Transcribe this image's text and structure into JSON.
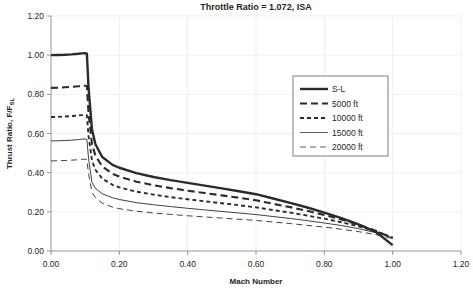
{
  "chart_data": {
    "type": "line",
    "title": "Throttle Ratio = 1.072, ISA",
    "xlabel": "Mach Number",
    "ylabel": "Thrust Ratio, F/F",
    "ylabel_sub": "SL",
    "xlim": [
      0.0,
      1.2
    ],
    "ylim": [
      0.0,
      1.2
    ],
    "grid": true,
    "legend_position": "upper-right-inside",
    "xticks": [
      "0.00",
      "0.20",
      "0.40",
      "0.60",
      "0.80",
      "1.00",
      "1.20"
    ],
    "xtick_values": [
      0.0,
      0.2,
      0.4,
      0.6,
      0.8,
      1.0,
      1.2
    ],
    "yticks": [
      "0.00",
      "0.20",
      "0.40",
      "0.60",
      "0.80",
      "1.00",
      "1.20"
    ],
    "ytick_values": [
      0.0,
      0.2,
      0.4,
      0.6,
      0.8,
      1.0,
      1.2
    ],
    "x": [
      0.0,
      0.02,
      0.04,
      0.06,
      0.08,
      0.09,
      0.1,
      0.105,
      0.11,
      0.12,
      0.13,
      0.15,
      0.18,
      0.2,
      0.25,
      0.3,
      0.35,
      0.4,
      0.45,
      0.5,
      0.55,
      0.6,
      0.65,
      0.7,
      0.75,
      0.8,
      0.85,
      0.9,
      0.95,
      1.0
    ],
    "series": [
      {
        "name": "S-L",
        "style": "solid-thick",
        "width": 2.4,
        "color": "#2b2b2b",
        "values": [
          1.0,
          1.001,
          1.002,
          1.004,
          1.007,
          1.009,
          1.01,
          1.008,
          0.83,
          0.62,
          0.545,
          0.48,
          0.44,
          0.425,
          0.398,
          0.378,
          0.362,
          0.348,
          0.334,
          0.32,
          0.305,
          0.29,
          0.268,
          0.246,
          0.222,
          0.196,
          0.168,
          0.136,
          0.098,
          0.03
        ]
      },
      {
        "name": "5000 ft",
        "style": "dashed-thick",
        "width": 2.1,
        "dash": "7,4",
        "color": "#2b2b2b",
        "values": [
          0.833,
          0.834,
          0.836,
          0.838,
          0.841,
          0.843,
          0.844,
          0.842,
          0.7,
          0.545,
          0.487,
          0.432,
          0.394,
          0.38,
          0.354,
          0.336,
          0.321,
          0.308,
          0.296,
          0.284,
          0.272,
          0.259,
          0.241,
          0.224,
          0.205,
          0.184,
          0.161,
          0.134,
          0.104,
          0.066
        ]
      },
      {
        "name": "10000 ft",
        "style": "dotted-dashed",
        "width": 1.9,
        "dash": "4,3",
        "color": "#2b2b2b",
        "values": [
          0.684,
          0.685,
          0.687,
          0.689,
          0.692,
          0.694,
          0.695,
          0.693,
          0.585,
          0.462,
          0.415,
          0.37,
          0.338,
          0.325,
          0.303,
          0.288,
          0.275,
          0.264,
          0.254,
          0.244,
          0.234,
          0.223,
          0.209,
          0.196,
          0.181,
          0.165,
          0.147,
          0.126,
          0.101,
          0.068
        ]
      },
      {
        "name": "15000 ft",
        "style": "solid-thin",
        "width": 0.9,
        "color": "#4a4a4a",
        "values": [
          0.562,
          0.563,
          0.564,
          0.566,
          0.569,
          0.571,
          0.572,
          0.57,
          0.47,
          0.35,
          0.32,
          0.292,
          0.272,
          0.263,
          0.247,
          0.236,
          0.227,
          0.218,
          0.21,
          0.202,
          0.194,
          0.186,
          0.176,
          0.166,
          0.155,
          0.143,
          0.13,
          0.114,
          0.094,
          0.068
        ]
      },
      {
        "name": "20000 ft",
        "style": "dashed-thin",
        "width": 0.9,
        "dash": "6,4",
        "color": "#4a4a4a",
        "values": [
          0.46,
          0.461,
          0.462,
          0.464,
          0.466,
          0.468,
          0.469,
          0.467,
          0.392,
          0.3,
          0.272,
          0.244,
          0.224,
          0.216,
          0.203,
          0.194,
          0.187,
          0.18,
          0.174,
          0.168,
          0.162,
          0.156,
          0.148,
          0.14,
          0.131,
          0.122,
          0.111,
          0.099,
          0.084,
          0.064
        ]
      }
    ]
  }
}
